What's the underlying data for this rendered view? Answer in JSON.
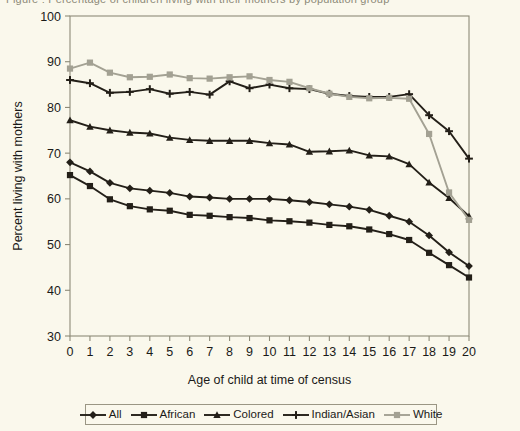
{
  "figure": {
    "cropped_caption_fragment": "Figure : Percentage of children living with their mothers by population group",
    "background_color": "#faf8ec",
    "axis_color": "#8d8a78"
  },
  "chart_data": {
    "type": "line",
    "title": "",
    "xlabel": "Age of child at time of census",
    "ylabel": "Percent living with mothers",
    "x": [
      0,
      1,
      2,
      3,
      4,
      5,
      6,
      7,
      8,
      9,
      10,
      11,
      12,
      13,
      14,
      15,
      16,
      17,
      18,
      19,
      20
    ],
    "xlim": [
      0,
      20
    ],
    "ylim": [
      30,
      100
    ],
    "yticks": [
      30,
      40,
      50,
      60,
      70,
      80,
      90,
      100
    ],
    "xticks": [
      0,
      1,
      2,
      3,
      4,
      5,
      6,
      7,
      8,
      9,
      10,
      11,
      12,
      13,
      14,
      15,
      16,
      17,
      18,
      19,
      20
    ],
    "grid": false,
    "legend_position": "bottom",
    "series": [
      {
        "name": "All",
        "marker": "diamond",
        "color": "#231f18",
        "values": [
          68.0,
          66.0,
          63.5,
          62.3,
          61.8,
          61.3,
          60.5,
          60.3,
          60.0,
          60.0,
          60.0,
          59.7,
          59.3,
          58.8,
          58.3,
          57.6,
          56.3,
          55.0,
          52.0,
          48.3,
          45.3
        ]
      },
      {
        "name": "African",
        "marker": "square",
        "color": "#231f18",
        "values": [
          65.2,
          62.8,
          59.9,
          58.4,
          57.7,
          57.4,
          56.5,
          56.3,
          56.0,
          55.8,
          55.3,
          55.1,
          54.8,
          54.3,
          54.0,
          53.3,
          52.3,
          51.0,
          48.2,
          45.5,
          42.8
        ]
      },
      {
        "name": "Colored",
        "marker": "triangle",
        "color": "#231f18",
        "values": [
          77.2,
          75.8,
          75.0,
          74.5,
          74.3,
          73.4,
          72.9,
          72.7,
          72.7,
          72.7,
          72.2,
          71.9,
          70.3,
          70.4,
          70.6,
          69.5,
          69.3,
          67.6,
          63.6,
          60.2,
          56.2
        ]
      },
      {
        "name": "Indian/Asian",
        "marker": "cross",
        "color": "#231f18",
        "values": [
          86.0,
          85.3,
          83.2,
          83.4,
          84.0,
          83.0,
          83.4,
          82.8,
          85.7,
          84.2,
          85.0,
          84.2,
          84.0,
          83.0,
          82.5,
          82.3,
          82.3,
          82.9,
          78.3,
          74.8,
          68.8
        ]
      },
      {
        "name": "White",
        "marker": "square",
        "color": "#a3a193",
        "values": [
          88.5,
          89.8,
          87.6,
          86.6,
          86.7,
          87.2,
          86.4,
          86.3,
          86.6,
          86.8,
          86.0,
          85.6,
          84.2,
          83.0,
          82.3,
          82.0,
          82.1,
          81.9,
          74.2,
          61.4,
          55.4
        ]
      }
    ]
  },
  "legend": {
    "entries": [
      {
        "label": "All",
        "marker": "diamond",
        "color": "#231f18"
      },
      {
        "label": "African",
        "marker": "square",
        "color": "#231f18"
      },
      {
        "label": "Colored",
        "marker": "triangle",
        "color": "#231f18"
      },
      {
        "label": "Indian/Asian",
        "marker": "cross",
        "color": "#231f18"
      },
      {
        "label": "White",
        "marker": "square",
        "color": "#a3a193"
      }
    ]
  }
}
